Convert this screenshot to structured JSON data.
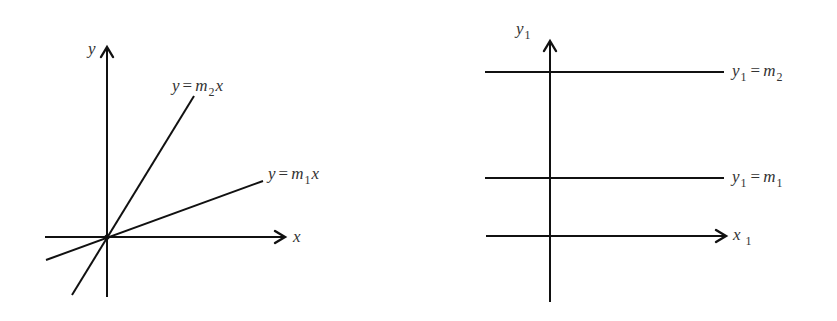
{
  "colors": {
    "background": "#ffffff",
    "stroke": "#111111",
    "label": "#333333"
  },
  "left_diagram": {
    "axes": {
      "y_label": "y",
      "x_label": "x"
    },
    "lines": [
      {
        "name": "steep-line",
        "lhs": "y",
        "op": "=",
        "coef": "m",
        "sub": "2",
        "var": "x"
      },
      {
        "name": "shallow-line",
        "lhs": "y",
        "op": "=",
        "coef": "m",
        "sub": "1",
        "var": "x"
      }
    ]
  },
  "right_diagram": {
    "axes": {
      "y_label": "y",
      "y_sub": "1",
      "x_label": "x",
      "x_sub": "1"
    },
    "lines": [
      {
        "name": "upper-horizontal",
        "lhs": "y",
        "lhs_sub": "1",
        "op": "=",
        "rhs": "m",
        "rhs_sub": "2"
      },
      {
        "name": "lower-horizontal",
        "lhs": "y",
        "lhs_sub": "1",
        "op": "=",
        "rhs": "m",
        "rhs_sub": "1"
      }
    ]
  }
}
